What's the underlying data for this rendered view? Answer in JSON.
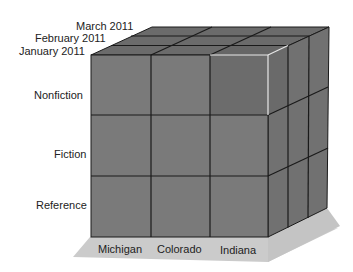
{
  "diagram": {
    "type": "olap-cube",
    "time_axis": {
      "labels": [
        "January 2011",
        "February 2011",
        "March 2011"
      ]
    },
    "category_axis": {
      "labels": [
        "Nonfiction",
        "Fiction",
        "Reference"
      ]
    },
    "region_axis": {
      "labels": [
        "Michigan",
        "Colorado",
        "Indiana"
      ]
    },
    "highlighted_cell": {
      "region": "Indiana",
      "category": "Nonfiction",
      "time": "January 2011"
    },
    "colors": {
      "front_face": "#7a7a7a",
      "top_face": "#6b6b6b",
      "side_face": "#717171",
      "highlight_face": "#6c6c6c",
      "highlight_outline": "#e8e8e8",
      "grid_line": "#1a1a1a",
      "shadow": "#c8c8c8",
      "text": "#222222"
    }
  }
}
